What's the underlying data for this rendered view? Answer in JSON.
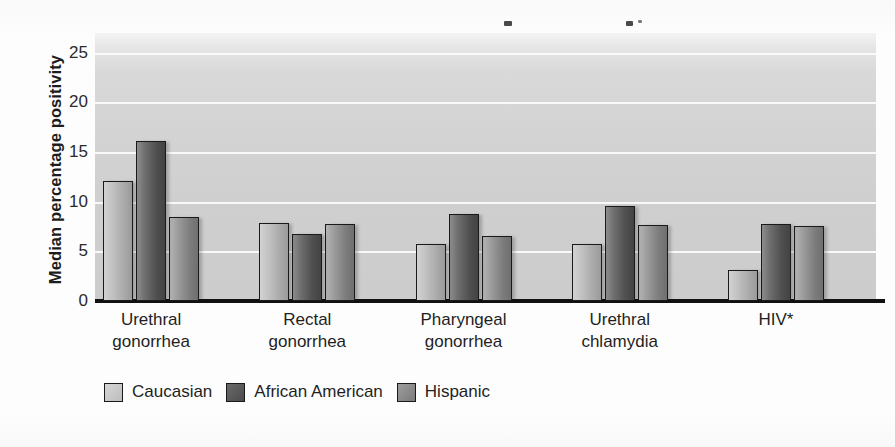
{
  "chart_data": {
    "type": "bar",
    "title": "",
    "subtitle": "",
    "xlabel": "",
    "ylabel": "Median percentage positivity",
    "ylim": [
      0,
      27
    ],
    "yticks": [
      0,
      5,
      10,
      15,
      20,
      25
    ],
    "ytick_labels": [
      "0",
      "5",
      "10",
      "15",
      "20",
      "25"
    ],
    "grid": true,
    "grid_axis": "y",
    "legend_position": "bottom-left",
    "orientation": "vertical",
    "categories": [
      "Urethral gonorrhea",
      "Rectal gonorrhea",
      "Pharyngeal gonorrhea",
      "Urethral chlamydia",
      "HIV*"
    ],
    "category_lines": [
      [
        "Urethral",
        "gonorrhea"
      ],
      [
        "Rectal",
        "gonorrhea"
      ],
      [
        "Pharyngeal",
        "gonorrhea"
      ],
      [
        "Urethral",
        "chlamydia"
      ],
      [
        "HIV*",
        ""
      ]
    ],
    "series": [
      {
        "name": "Caucasian",
        "color": "#c2c2c2",
        "values": [
          12.1,
          7.9,
          5.7,
          5.7,
          3.1
        ]
      },
      {
        "name": "African American",
        "color": "#5a5a5a",
        "values": [
          16.1,
          6.8,
          8.8,
          9.6,
          7.8
        ]
      },
      {
        "name": "Hispanic",
        "color": "#8e8e8e",
        "values": [
          8.5,
          7.8,
          6.6,
          7.7,
          7.6
        ]
      }
    ],
    "annotations": [
      "* HIV category is marked with an asterisk"
    ]
  },
  "legend": {
    "items": [
      {
        "label": "Caucasian"
      },
      {
        "label": "African American"
      },
      {
        "label": "Hispanic"
      }
    ]
  }
}
